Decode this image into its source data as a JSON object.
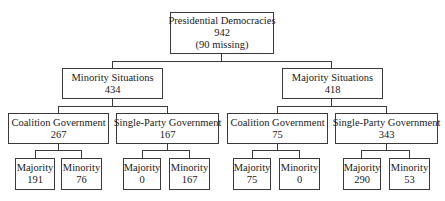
{
  "root": {
    "label": "Presidential Democracies",
    "value": "942",
    "note": "(90 missing)"
  },
  "minority_situations": {
    "label": "Minority Situations",
    "value": "434",
    "coalition": {
      "label": "Coalition Government",
      "value": "267",
      "majority": {
        "label": "Majority",
        "value": "191"
      },
      "minority": {
        "label": "Minority",
        "value": "76"
      }
    },
    "single_party": {
      "label": "Single-Party Government",
      "value": "167",
      "majority": {
        "label": "Majority",
        "value": "0"
      },
      "minority": {
        "label": "Minority",
        "value": "167"
      }
    }
  },
  "majority_situations": {
    "label": "Majority Situations",
    "value": "418",
    "coalition": {
      "label": "Coalition Government",
      "value": "75",
      "majority": {
        "label": "Majority",
        "value": "75"
      },
      "minority": {
        "label": "Minority",
        "value": "0"
      }
    },
    "single_party": {
      "label": "Single-Party Government",
      "value": "343",
      "majority": {
        "label": "Majority",
        "value": "290"
      },
      "minority": {
        "label": "Minority",
        "value": "53"
      }
    }
  }
}
